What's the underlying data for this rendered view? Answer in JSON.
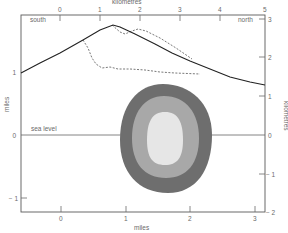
{
  "diagram": {
    "top_axis": {
      "label": "kilometres",
      "ticks": [
        "0",
        "1",
        "2",
        "3",
        "4",
        "5"
      ]
    },
    "bottom_axis": {
      "label": "miles",
      "ticks": [
        "0",
        "1",
        "2",
        "3"
      ]
    },
    "left_axis": {
      "label": "miles",
      "ticks": [
        "1",
        "0",
        "− 1"
      ]
    },
    "right_axis": {
      "label": "kilometres",
      "ticks": [
        "3",
        "2",
        "1",
        "0",
        "− 1",
        "− 2"
      ]
    },
    "annotations": {
      "south": "south",
      "north": "north",
      "sea_level": "sea level"
    },
    "colors": {
      "outer_ring": "#6e6e6e",
      "middle_ring": "#a8a8a8",
      "inner_core": "#e6e6e6",
      "profile_line": "#222222",
      "dashed_line": "#555555"
    }
  }
}
